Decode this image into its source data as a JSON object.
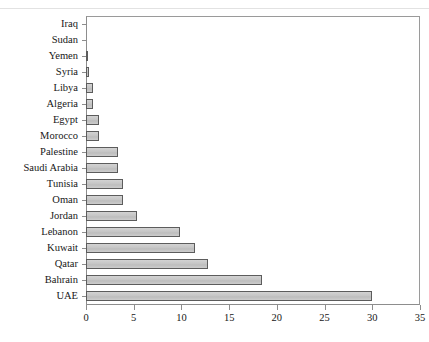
{
  "chart_data": {
    "type": "bar",
    "orientation": "horizontal",
    "title": "",
    "xlabel": "",
    "ylabel": "",
    "xlim": [
      0,
      35
    ],
    "xticks": [
      0,
      5,
      10,
      15,
      20,
      25,
      30,
      35
    ],
    "xtick_labels": [
      "0",
      "5",
      "10",
      "15",
      "20",
      "25",
      "30",
      "35"
    ],
    "grid": false,
    "legend": "none",
    "bar_fill_color": "#c8c8c8",
    "bar_edge_color": "#5c5c5c",
    "axis_color": "#8d8d8d",
    "categories": [
      "Iraq",
      "Sudan",
      "Yemen",
      "Syria",
      "Libya",
      "Algeria",
      "Egypt",
      "Morocco",
      "Palestine",
      "Saudi Arabia",
      "Tunisia",
      "Oman",
      "Jordan",
      "Lebanon",
      "Kuwait",
      "Qatar",
      "Bahrain",
      "UAE"
    ],
    "values": [
      0,
      0,
      0.15,
      0.35,
      0.7,
      0.7,
      1.4,
      1.4,
      3.4,
      3.4,
      3.9,
      3.9,
      5.3,
      9.8,
      11.4,
      12.8,
      18.4,
      30
    ]
  }
}
